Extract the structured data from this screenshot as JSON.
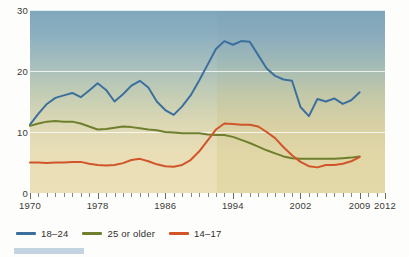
{
  "chart_data": {
    "type": "line",
    "title": "",
    "xlabel": "",
    "ylabel": "",
    "xlim": [
      1970,
      2012
    ],
    "ylim": [
      0,
      30
    ],
    "grid": "horizontal gridlines at 10, 20, 30",
    "legend_position": "below-left",
    "x": [
      1970,
      1971,
      1972,
      1973,
      1974,
      1975,
      1976,
      1977,
      1978,
      1979,
      1980,
      1981,
      1982,
      1983,
      1984,
      1985,
      1986,
      1987,
      1988,
      1989,
      1990,
      1991,
      1992,
      1993,
      1994,
      1995,
      1996,
      1997,
      1998,
      1999,
      2000,
      2001,
      2002,
      2003,
      2004,
      2005,
      2006,
      2007,
      2008,
      2009
    ],
    "y_ticks": [
      0,
      10,
      20,
      30
    ],
    "x_ticks_major": [
      1970,
      1978,
      1986,
      1994,
      2002,
      2009,
      2012
    ],
    "series": [
      {
        "name": "18-24",
        "color": "#3d6f9e",
        "values": [
          11.2,
          13.0,
          14.6,
          15.6,
          16.0,
          16.4,
          15.7,
          16.8,
          18.0,
          16.9,
          15.0,
          16.2,
          17.6,
          18.4,
          17.3,
          15.0,
          13.6,
          12.8,
          14.2,
          16.0,
          18.4,
          21.0,
          23.6,
          24.9,
          24.3,
          24.9,
          24.8,
          22.6,
          20.4,
          19.2,
          18.6,
          18.4,
          14.1,
          12.6,
          15.4,
          15.0,
          15.5,
          14.6,
          15.2,
          16.5
        ]
      },
      {
        "name": "25 or older",
        "color": "#6f7f2e",
        "values": [
          11.0,
          11.4,
          11.7,
          11.8,
          11.7,
          11.7,
          11.4,
          10.9,
          10.4,
          10.5,
          10.7,
          10.9,
          10.8,
          10.6,
          10.4,
          10.3,
          10.0,
          9.9,
          9.8,
          9.8,
          9.8,
          9.6,
          9.5,
          9.5,
          9.2,
          8.7,
          8.2,
          7.6,
          7.0,
          6.5,
          6.0,
          5.7,
          5.6,
          5.6,
          5.6,
          5.6,
          5.6,
          5.7,
          5.8,
          6.0
        ]
      },
      {
        "name": "14-17",
        "color": "#d2552a",
        "values": [
          5.0,
          5.0,
          4.9,
          5.0,
          5.0,
          5.1,
          5.1,
          4.8,
          4.6,
          4.5,
          4.6,
          4.9,
          5.4,
          5.6,
          5.2,
          4.7,
          4.4,
          4.3,
          4.6,
          5.4,
          6.8,
          8.6,
          10.4,
          11.4,
          11.3,
          11.2,
          11.2,
          10.9,
          10.0,
          9.0,
          7.5,
          6.2,
          5.1,
          4.4,
          4.2,
          4.6,
          4.6,
          4.8,
          5.2,
          5.9
        ]
      }
    ],
    "shading_note": "background gradient shifts to a warmer sand tone at about 1992"
  },
  "axis": {
    "y_labels": [
      "30",
      "20",
      "10",
      "0"
    ],
    "x_labels": [
      "1970",
      "1978",
      "1986",
      "1994",
      "2002",
      "2009",
      "2012"
    ]
  },
  "legend": {
    "items": [
      {
        "label": "18–24",
        "color": "#3d6f9e"
      },
      {
        "label": "25 or older",
        "color": "#6f7f2e"
      },
      {
        "label": "14–17",
        "color": "#d2552a"
      }
    ]
  }
}
